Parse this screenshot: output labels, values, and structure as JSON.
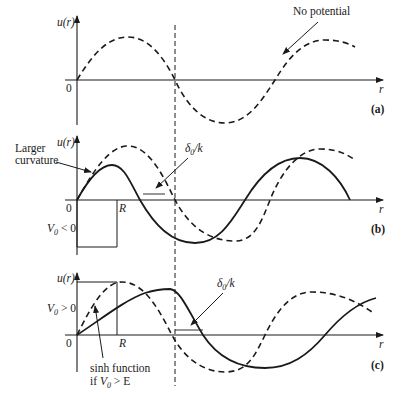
{
  "figure": {
    "panels": [
      {
        "id": "a",
        "tag": "(a)",
        "y_axis_label": "u(r)",
        "x_axis_label": "r",
        "origin_label": "0",
        "annotations": [
          {
            "text": "No potential",
            "points_to": "dashed-curve"
          }
        ]
      },
      {
        "id": "b",
        "tag": "(b)",
        "y_axis_label": "u(r)",
        "x_axis_label": "r",
        "origin_label": "0",
        "well_edge_label": "R",
        "potential_label": "V₀ < 0",
        "potential_label_parts": {
          "v": "V",
          "sub": "0",
          "rel": " < 0"
        },
        "annotations": [
          {
            "text_line1": "Larger",
            "text_line2": "curvature"
          },
          {
            "text": "δ₀/k",
            "parts": {
              "delta": "δ",
              "sub": "0",
              "rest": "/k"
            }
          }
        ]
      },
      {
        "id": "c",
        "tag": "(c)",
        "y_axis_label": "u(r)",
        "x_axis_label": "r",
        "origin_label": "0",
        "well_edge_label": "R",
        "potential_label": "V₀ > 0",
        "potential_label_parts": {
          "v": "V",
          "sub": "0",
          "rel": " > 0"
        },
        "annotations": [
          {
            "text_line1": "sinh function",
            "text_line2_prefix": "if ",
            "text_line2_v": "V",
            "text_line2_sub": "0",
            "text_line2_rest": " > E"
          },
          {
            "text": "δ₀/k",
            "parts": {
              "delta": "δ",
              "sub": "0",
              "rest": "/k"
            }
          }
        ]
      }
    ],
    "legend_semantics": {
      "dashed": "free wave (no potential)",
      "solid": "wave with potential"
    },
    "colors": {
      "ink": "#1a1a1a",
      "background": "#ffffff"
    }
  }
}
